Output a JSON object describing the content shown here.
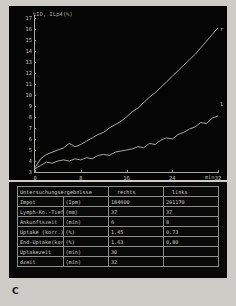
{
  "panel_letter": "C",
  "chart_data": {
    "type": "line",
    "title": "%ID, ILp4(%)",
    "xlabel": "min",
    "ylabel": "%ID, ILp4(%)",
    "xlim": [
      0,
      32
    ],
    "ylim": [
      3,
      17
    ],
    "xticks": [
      0,
      8,
      16,
      24,
      32
    ],
    "yticks": [
      3,
      4,
      5,
      6,
      7,
      8,
      9,
      10,
      11,
      12,
      13,
      14,
      15,
      16,
      17
    ],
    "grid": false,
    "legend_position": "inline-right",
    "series": [
      {
        "name": "r",
        "label": "r",
        "color": "#d8d8d1",
        "x": [
          0,
          1,
          2,
          3,
          4,
          5,
          6,
          7,
          8,
          9,
          10,
          11,
          12,
          13,
          14,
          15,
          16,
          17,
          18,
          19,
          20,
          21,
          22,
          23,
          24,
          25,
          26,
          27,
          28,
          29,
          30,
          31,
          32
        ],
        "y": [
          3.4,
          4.2,
          4.6,
          4.8,
          5.0,
          5.2,
          5.6,
          5.3,
          5.5,
          5.8,
          6.1,
          6.4,
          6.6,
          7.0,
          7.3,
          7.6,
          8.0,
          8.5,
          8.8,
          9.3,
          9.8,
          10.2,
          10.7,
          11.2,
          11.7,
          12.2,
          12.7,
          13.2,
          13.7,
          14.3,
          14.9,
          15.5,
          16.1
        ]
      },
      {
        "name": "l",
        "label": "l",
        "color": "#cfcfc8",
        "x": [
          0,
          1,
          2,
          3,
          4,
          5,
          6,
          7,
          8,
          9,
          10,
          11,
          12,
          13,
          14,
          15,
          16,
          17,
          18,
          19,
          20,
          21,
          22,
          23,
          24,
          25,
          26,
          27,
          28,
          29,
          30,
          31,
          32
        ],
        "y": [
          3.3,
          3.6,
          3.9,
          3.8,
          4.0,
          4.1,
          4.0,
          4.2,
          4.1,
          4.3,
          4.2,
          4.5,
          4.6,
          4.5,
          4.8,
          4.9,
          5.0,
          5.1,
          5.3,
          5.2,
          5.6,
          5.5,
          5.9,
          6.1,
          6.0,
          6.4,
          6.6,
          6.9,
          7.1,
          7.5,
          7.4,
          7.9,
          8.1
        ]
      }
    ]
  },
  "table": {
    "headers": {
      "label": "Untersuchungsergebnisse",
      "right": "rechts",
      "left": "links"
    },
    "rows": [
      {
        "label": "Impot",
        "unit": "(Ipm)",
        "right": "184600",
        "left": "201170"
      },
      {
        "label": "Lymph-Kn.-Tiefe",
        "unit": "(mm)",
        "right": "37",
        "left": "37"
      },
      {
        "label": "Ankunftszeit",
        "unit": "(min)",
        "right": "6",
        "left": "8"
      },
      {
        "label": "Uptake (korr.)",
        "unit": "(%)",
        "right": "1.45",
        "left": "0.73"
      },
      {
        "label": "End-Uptake(korr.)",
        "unit": "(%)",
        "right": "1.63",
        "left": "0.80"
      },
      {
        "label": "Uptakezeit",
        "unit": "(min)",
        "right": "30",
        "left": ""
      },
      {
        "label": "dzeit",
        "unit": "(min)",
        "right": "32",
        "left": ""
      }
    ]
  }
}
